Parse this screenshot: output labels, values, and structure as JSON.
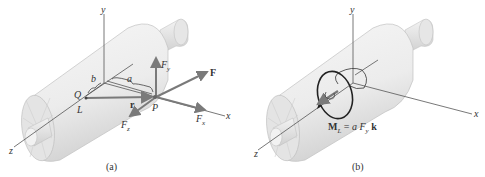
{
  "figure": {
    "panels": [
      {
        "id": "a",
        "caption": "(a)",
        "axes": {
          "x": "x",
          "y": "y",
          "z": "z"
        },
        "points": {
          "Q": "Q",
          "P": "P",
          "L": "L"
        },
        "dimensions": {
          "a": "a",
          "b": "b"
        },
        "vectors": {
          "r": "r",
          "F": "F",
          "Fx": "F",
          "Fx_sub": "x",
          "Fy": "F",
          "Fy_sub": "y",
          "Fz": "F",
          "Fz_sub": "z"
        }
      },
      {
        "id": "b",
        "caption": "(b)",
        "axes": {
          "x": "x",
          "y": "y",
          "z": "z"
        },
        "moment_label": {
          "M": "M",
          "M_sub": "L",
          "eq": " = ",
          "a": "a",
          "F": " F",
          "F_sub": "y",
          "k": " k"
        }
      }
    ],
    "colors": {
      "cylinder": "#ededed",
      "cylinder_shade": "#d6d6d6",
      "vector": "#7a7a7a",
      "axis": "#555555",
      "moment": "#222222"
    }
  }
}
